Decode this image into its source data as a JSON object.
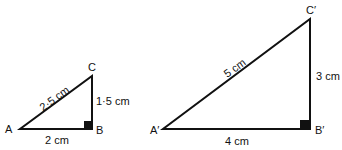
{
  "small_triangle": {
    "vertices": {
      "A": "A",
      "B": "B",
      "C": "C"
    },
    "sides": {
      "AB": "2 cm",
      "BC": "1·5 cm",
      "AC": "2·5 cm"
    }
  },
  "large_triangle": {
    "vertices": {
      "A": "A′",
      "B": "B′",
      "C": "C′"
    },
    "sides": {
      "AB": "4 cm",
      "BC": "3 cm",
      "AC": "5 cm"
    }
  },
  "colors": {
    "stroke": "#111111",
    "background": "#ffffff"
  }
}
